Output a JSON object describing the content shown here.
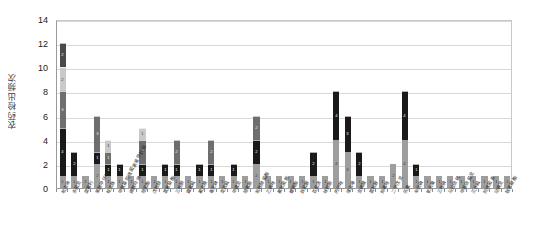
{
  "chart_data": {
    "type": "bar",
    "subtype": "stacked-column",
    "title": "",
    "xlabel": "",
    "ylabel": "农药检出频次",
    "ylim": [
      0,
      14
    ],
    "ytick_values": [
      0,
      2,
      4,
      6,
      8,
      10,
      12,
      14
    ],
    "ytick_labels": [
      "0",
      "2",
      "4",
      "6",
      "8",
      "10",
      "12",
      "14"
    ],
    "grid": true,
    "grid_axis": "y",
    "legend": false,
    "legend_position": "none",
    "data_labels": true,
    "categories": [
      "吡虫啉",
      "多菌灵",
      "腐霉利",
      "苯醚甲环唑",
      "啶虫脒",
      "甲氨基阿维菌素苯甲酸盐",
      "烯酰吗啉",
      "嘧菌酯",
      "戊唑醇",
      "氯氰菊酯",
      "三唑酮",
      "霜霉威",
      "氟虫腈",
      "毒死蜱",
      "克百威",
      "甲霜灵",
      "嘧霉胺",
      "吡唑醚菌酯",
      "乙螨唑",
      "氟吡菌胺",
      "螺螨酯",
      "异菌脲",
      "百菌清",
      "咪鲜胺",
      "丙环唑",
      "噻虫嗪",
      "虫螨腈",
      "氯吡脲",
      "抑霉唑",
      "二甲戊灵",
      "乐果",
      "辛硫磷",
      "氧乐果",
      "三唑磷",
      "马拉硫磷",
      "甲基硫菌灵",
      "灭多威",
      "阿维菌素",
      "哒螨灵",
      "联苯菊酯"
    ],
    "stacks": [
      {
        "category": "吡虫啉",
        "segments": [
          1,
          4,
          3,
          2,
          2
        ],
        "total": 12
      },
      {
        "category": "多菌灵",
        "segments": [
          1,
          2
        ],
        "total": 3
      },
      {
        "category": "腐霉利",
        "segments": [
          1
        ],
        "total": 1
      },
      {
        "category": "苯醚甲环唑",
        "segments": [
          2,
          1,
          3
        ],
        "total": 6
      },
      {
        "category": "啶虫脒",
        "segments": [
          1,
          1,
          1,
          1
        ],
        "total": 4
      },
      {
        "category": "甲氨基阿维菌素苯甲酸盐",
        "segments": [
          1,
          1
        ],
        "total": 2
      },
      {
        "category": "烯酰吗啉",
        "segments": [
          1
        ],
        "total": 1
      },
      {
        "category": "嘧菌酯",
        "segments": [
          1,
          1,
          2,
          1
        ],
        "total": 5
      },
      {
        "category": "戊唑醇",
        "segments": [
          1
        ],
        "total": 1
      },
      {
        "category": "氯氰菊酯",
        "segments": [
          1,
          1
        ],
        "total": 2
      },
      {
        "category": "三唑酮",
        "segments": [
          1,
          1,
          2
        ],
        "total": 4
      },
      {
        "category": "霜霉威",
        "segments": [
          1
        ],
        "total": 1
      },
      {
        "category": "氟虫腈",
        "segments": [
          1,
          1
        ],
        "total": 2
      },
      {
        "category": "毒死蜱",
        "segments": [
          1,
          1,
          2
        ],
        "total": 4
      },
      {
        "category": "克百威",
        "segments": [
          1
        ],
        "total": 1
      },
      {
        "category": "甲霜灵",
        "segments": [
          1,
          1
        ],
        "total": 2
      },
      {
        "category": "嘧霉胺",
        "segments": [
          1
        ],
        "total": 1
      },
      {
        "category": "吡唑醚菌酯",
        "segments": [
          2,
          2,
          2
        ],
        "total": 6
      },
      {
        "category": "乙螨唑",
        "segments": [
          1
        ],
        "total": 1
      },
      {
        "category": "氟吡菌胺",
        "segments": [
          1
        ],
        "total": 1
      },
      {
        "category": "螺螨酯",
        "segments": [
          1
        ],
        "total": 1
      },
      {
        "category": "异菌脲",
        "segments": [
          1
        ],
        "total": 1
      },
      {
        "category": "百菌清",
        "segments": [
          1,
          2
        ],
        "total": 3
      },
      {
        "category": "咪鲜胺",
        "segments": [
          1
        ],
        "total": 1
      },
      {
        "category": "丙环唑",
        "segments": [
          4,
          4
        ],
        "total": 8
      },
      {
        "category": "噻虫嗪",
        "segments": [
          3,
          3
        ],
        "total": 6
      },
      {
        "category": "虫螨腈",
        "segments": [
          1,
          2
        ],
        "total": 3
      },
      {
        "category": "氯吡脲",
        "segments": [
          1
        ],
        "total": 1
      },
      {
        "category": "抑霉唑",
        "segments": [
          1
        ],
        "total": 1
      },
      {
        "category": "二甲戊灵",
        "segments": [
          2
        ],
        "total": 2
      },
      {
        "category": "乐果",
        "segments": [
          4,
          4
        ],
        "total": 8
      },
      {
        "category": "辛硫磷",
        "segments": [
          1,
          1
        ],
        "total": 2
      },
      {
        "category": "氧乐果",
        "segments": [
          1
        ],
        "total": 1
      },
      {
        "category": "三唑磷",
        "segments": [
          1
        ],
        "total": 1
      },
      {
        "category": "马拉硫磷",
        "segments": [
          1
        ],
        "total": 1
      },
      {
        "category": "甲基硫菌灵",
        "segments": [
          1
        ],
        "total": 1
      },
      {
        "category": "灭多威",
        "segments": [
          1
        ],
        "total": 1
      },
      {
        "category": "阿维菌素",
        "segments": [
          1
        ],
        "total": 1
      },
      {
        "category": "哒螨灵",
        "segments": [
          1
        ],
        "total": 1
      },
      {
        "category": "联苯菊酯",
        "segments": [
          1
        ],
        "total": 1
      }
    ],
    "segment_colors": [
      "#9e9e9e",
      "#1a1a1a",
      "#6e6e6e",
      "#c9c9c9",
      "#4a4a4a",
      "#b0b0b0"
    ],
    "colors": {
      "plot_background": "#ffffff",
      "gridline": "#d9d9d9",
      "axis_line": "#9a9a9a",
      "tick_text": "#1a1a1a",
      "label_text": "#2b2b2b"
    }
  }
}
